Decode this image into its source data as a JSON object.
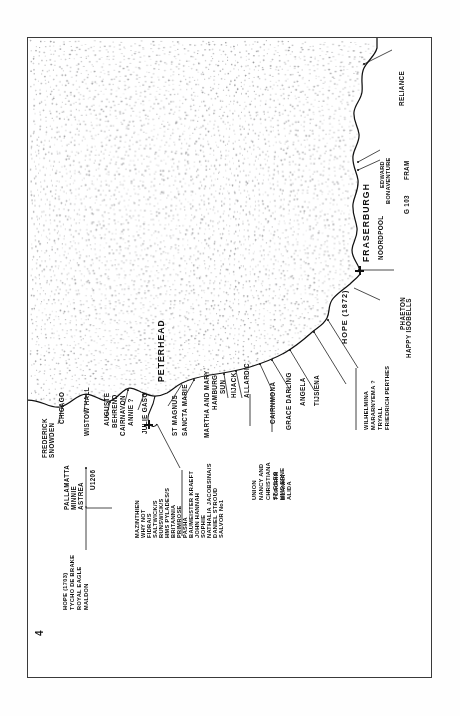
{
  "page": {
    "folio": "4",
    "orientation": "landscape-rotated-90ccw",
    "frame_color": "#3a3a3a",
    "ink_color": "#101010",
    "sea_color": "#ffffff",
    "land_texture": "stipple-dots"
  },
  "towns": [
    {
      "name": "FRASERBURGH",
      "marker": "cross"
    },
    {
      "name": "PETERHEAD",
      "marker": "cross"
    }
  ],
  "coast_labels": [
    {
      "name": "RELIANCE"
    },
    {
      "name": "EDWARD"
    },
    {
      "name": "BONAVENTURE"
    },
    {
      "name": "FRAM"
    },
    {
      "name": "G 103"
    },
    {
      "name": "NOORDPOOL"
    },
    {
      "name": "PHAETON"
    },
    {
      "name": "HAPPY ISOBELLS"
    },
    {
      "name": "HOPE (1872)"
    },
    {
      "name": "TIJSIENA"
    },
    {
      "name": "ANGELA"
    },
    {
      "name": "GRACE DARLING"
    },
    {
      "name": "CAIRNMONA"
    },
    {
      "name": "ALLARDIC"
    },
    {
      "name": "HIJACK"
    },
    {
      "name": "SUN"
    },
    {
      "name": "HAMBURG"
    },
    {
      "name": "MARTHA AND MARY"
    },
    {
      "name": "SANCTA MARIE"
    },
    {
      "name": "ST MAGNUS"
    },
    {
      "name": "JULIE GASO"
    },
    {
      "name": "ANNIE ?"
    },
    {
      "name": "CAIRNAVON"
    },
    {
      "name": "BEHREND"
    },
    {
      "name": "AUGUSTE"
    },
    {
      "name": "WISTOW HALL"
    },
    {
      "name": "CHICAGO"
    },
    {
      "name": "FREDERICK"
    },
    {
      "name": "SNOWDEN"
    },
    {
      "name": "PALLAMATTA"
    },
    {
      "name": "MINNIE"
    },
    {
      "name": "ASTREA"
    },
    {
      "name": "U1206"
    }
  ],
  "list_groups": [
    {
      "id": "wilhelmina-group",
      "items": [
        "WILHELMINA",
        "MARARNYEMA ?",
        "TRYALL",
        "FRIEDRICH PERTHES"
      ]
    },
    {
      "id": "torgrim-group",
      "items": [
        "TORGRIM",
        "BLANKA"
      ]
    },
    {
      "id": "union-group",
      "items": [
        "UNION",
        "NANCY AND",
        "CHRISTIANA",
        "ST GILES",
        "HMS ERNE",
        "ALIDA"
      ]
    },
    {
      "id": "mazinthien-group",
      "items": [
        "MAZINTHIEN",
        "WHY NOT",
        "FIDRA/S",
        "SALTWICK/S",
        "RUNSWICK/S",
        "HMS PYLADES/S",
        "BRITANNIA",
        "PRIMROSE",
        "PASHA",
        "BAUMEISTER KRAEFT",
        "JOHN HANNAH",
        "SOPHIE",
        "NATHALIA JACOBSINA/S",
        "DANIEL STROUD",
        "SALVOR No1"
      ]
    },
    {
      "id": "hope1703-group",
      "items": [
        "HOPE (1703)",
        "TYCHO DE BRAKE",
        "ROYAL EAGLE",
        "MALDON"
      ]
    }
  ]
}
